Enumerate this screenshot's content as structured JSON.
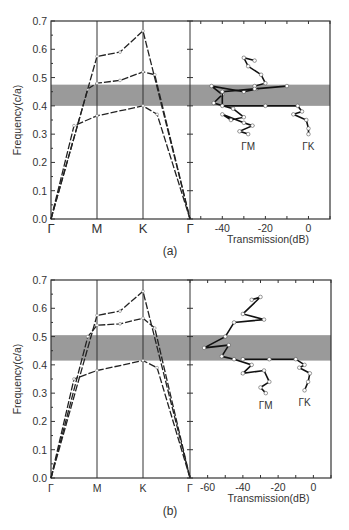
{
  "figure": {
    "panels": [
      {
        "caption": "(a)"
      },
      {
        "caption": "(b)"
      }
    ]
  },
  "chart_data": [
    {
      "type": "line",
      "panel": "(a) band structure",
      "title": "",
      "xlabel": "",
      "ylabel": "Frequency(c/a)",
      "ylim": [
        0.0,
        0.7
      ],
      "yticks": [
        "0.0",
        "0.1",
        "0.2",
        "0.3",
        "0.4",
        "0.5",
        "0.6",
        "0.7"
      ],
      "categories": [
        "Γ",
        "M",
        "K",
        "Γ"
      ],
      "grid": false,
      "band_gap": [
        0.4,
        0.475
      ],
      "series": [
        {
          "name": "band 1",
          "x": [
            0,
            0.5,
            1.0,
            2.0,
            2.3,
            3.0
          ],
          "values": [
            0.0,
            0.33,
            0.365,
            0.4,
            0.37,
            0.0
          ]
        },
        {
          "name": "band 2",
          "x": [
            0,
            0.8,
            1.0,
            1.5,
            2.0,
            2.25,
            3.0
          ],
          "values": [
            0.0,
            0.46,
            0.48,
            0.49,
            0.52,
            0.51,
            0.0
          ]
        },
        {
          "name": "band 3",
          "x": [
            0,
            1.0,
            1.5,
            2.0,
            3.0
          ],
          "values": [
            0.0,
            0.575,
            0.59,
            0.665,
            0.0
          ]
        }
      ]
    },
    {
      "type": "line",
      "panel": "(a) transmission",
      "xlabel": "Transmission(dB)",
      "xlim": [
        -55,
        10
      ],
      "xticks": [
        "-40",
        "-20",
        "0"
      ],
      "ylim": [
        0.0,
        0.7
      ],
      "band_gap": [
        0.4,
        0.475
      ],
      "annotations": [
        "ΓM",
        "ΓK"
      ],
      "series": [
        {
          "name": "ΓM",
          "x": [
            -25,
            -30,
            -28,
            -22,
            -20,
            -25,
            -24,
            -30,
            -45,
            -40,
            -44,
            -35,
            -30,
            -36,
            -40,
            -30,
            -26,
            -32,
            -28
          ],
          "y": [
            0.56,
            0.57,
            0.54,
            0.51,
            0.48,
            0.47,
            0.46,
            0.45,
            0.47,
            0.44,
            0.41,
            0.39,
            0.36,
            0.35,
            0.37,
            0.34,
            0.33,
            0.31,
            0.3
          ]
        },
        {
          "name": "ΓK",
          "x": [
            -10,
            -25,
            -40,
            -40,
            -20,
            -5,
            -3,
            -7,
            -1,
            0,
            0
          ],
          "y": [
            0.47,
            0.46,
            0.45,
            0.4,
            0.4,
            0.4,
            0.38,
            0.37,
            0.35,
            0.32,
            0.3
          ]
        }
      ]
    },
    {
      "type": "line",
      "panel": "(b) band structure",
      "ylabel": "Frequency(c/a)",
      "ylim": [
        0.0,
        0.7
      ],
      "yticks": [
        "0.0",
        "0.1",
        "0.2",
        "0.3",
        "0.4",
        "0.5",
        "0.6",
        "0.7"
      ],
      "categories": [
        "Γ",
        "M",
        "K",
        "Γ"
      ],
      "grid": false,
      "band_gap": [
        0.415,
        0.505
      ],
      "series": [
        {
          "name": "band 1",
          "x": [
            0,
            0.5,
            1.0,
            2.0,
            2.3,
            3.0
          ],
          "values": [
            0.0,
            0.35,
            0.38,
            0.415,
            0.39,
            0.0
          ]
        },
        {
          "name": "band 2",
          "x": [
            0,
            0.8,
            1.0,
            1.5,
            2.0,
            2.25,
            3.0
          ],
          "values": [
            0.0,
            0.5,
            0.54,
            0.545,
            0.565,
            0.53,
            0.0
          ]
        },
        {
          "name": "band 3",
          "x": [
            0,
            1.0,
            1.5,
            2.0,
            3.0
          ],
          "values": [
            0.0,
            0.575,
            0.59,
            0.66,
            0.0
          ]
        }
      ]
    },
    {
      "type": "line",
      "panel": "(b) transmission",
      "xlabel": "Transmission(dB)",
      "xlim": [
        -70,
        10
      ],
      "xticks": [
        "-60",
        "-40",
        "-20",
        "0"
      ],
      "ylim": [
        0.0,
        0.7
      ],
      "band_gap": [
        0.415,
        0.505
      ],
      "annotations": [
        "ΓM",
        "ΓK"
      ],
      "series": [
        {
          "name": "ΓM",
          "x": [
            -35,
            -30,
            -40,
            -28,
            -45,
            -50,
            -62,
            -48,
            -52,
            -45,
            -35,
            -40,
            -28,
            -25,
            -30,
            -27
          ],
          "y": [
            0.63,
            0.64,
            0.58,
            0.56,
            0.55,
            0.5,
            0.46,
            0.47,
            0.43,
            0.42,
            0.4,
            0.37,
            0.38,
            0.34,
            0.32,
            0.3
          ]
        },
        {
          "name": "ΓK",
          "x": [
            -40,
            -25,
            -10,
            -5,
            -8,
            -2,
            -3,
            -5
          ],
          "y": [
            0.42,
            0.42,
            0.42,
            0.4,
            0.39,
            0.37,
            0.34,
            0.31
          ]
        }
      ]
    }
  ]
}
